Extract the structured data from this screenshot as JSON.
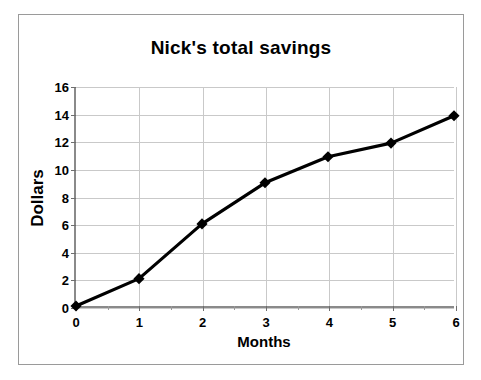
{
  "chart_data": {
    "type": "line",
    "title": "Nick's total savings",
    "xlabel": "Months",
    "ylabel": "Dollars",
    "x": [
      0,
      1,
      2,
      3,
      4,
      5,
      6
    ],
    "values": [
      0,
      2,
      6,
      9,
      10.9,
      11.9,
      13.9
    ],
    "series": [
      {
        "name": "Nick's total savings",
        "values": [
          0,
          2,
          6,
          9,
          10.9,
          11.9,
          13.9
        ]
      }
    ],
    "xlim": [
      0,
      6
    ],
    "ylim": [
      0,
      16
    ],
    "x_ticks": [
      "0",
      "1",
      "2",
      "3",
      "4",
      "5",
      "6"
    ],
    "y_ticks": [
      "0",
      "2",
      "4",
      "6",
      "8",
      "10",
      "12",
      "14",
      "16"
    ],
    "x_minor_tick_step": 0.5,
    "grid": true,
    "legend": false,
    "marker": "diamond",
    "line_color": "#000000",
    "marker_color": "#000000",
    "grid_color": "#c9c9c9",
    "axis_color": "#8a8a8a",
    "frame_color": "#9a9a9a",
    "background_color": "#ffffff"
  }
}
